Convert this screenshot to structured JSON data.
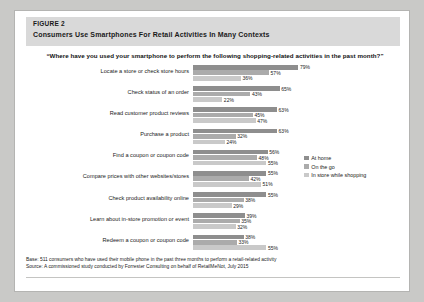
{
  "figure": {
    "number": "FIGURE 2",
    "title": "Consumers Use Smartphones For Retail Activities In Many Contexts",
    "question": "“Where have you used your smartphone to perform the following shopping-related activities in the past month?”"
  },
  "footnotes": {
    "base": "Base: 511 consumers who have used their mobile phone in the past three months to perform a retail-related activity",
    "source": "Source: A commissioned study conducted by Forrester Consulting on behalf of RetailMeNot, July 2015"
  },
  "colors": {
    "series_at_home": "#8e8e8e",
    "series_on_the_go": "#ababab",
    "series_in_store": "#c9c9c9",
    "header_band": "#d9d9d9",
    "page_background": "#c9c9c7",
    "card_background": "#ffffff"
  },
  "chart_data": {
    "type": "bar",
    "orientation": "horizontal",
    "grouped": true,
    "title": "Consumers Use Smartphones For Retail Activities In Many Contexts",
    "subtitle": "“Where have you used your smartphone to perform the following shopping-related activities in the past month?”",
    "xlabel": "",
    "ylabel": "",
    "xlim": [
      0,
      80
    ],
    "grid": false,
    "legend_position": "right",
    "value_suffix": "%",
    "categories": [
      "Locate a store or check store hours",
      "Check status of an order",
      "Read customer product reviews",
      "Purchase a product",
      "Find a coupon or coupon code",
      "Compare prices with other websites/stores",
      "Check product availability online",
      "Learn about in-store promotion or event",
      "Redeem a coupon or coupon code"
    ],
    "series": [
      {
        "name": "At home",
        "color": "#8e8e8e",
        "values": [
          79,
          65,
          63,
          63,
          56,
          55,
          55,
          39,
          38
        ],
        "labels": [
          "79%",
          "65%",
          "63%",
          "63%",
          "56%",
          "55%",
          "55%",
          "39%",
          "38%"
        ]
      },
      {
        "name": "On the go",
        "color": "#ababab",
        "values": [
          57,
          43,
          45,
          32,
          48,
          42,
          38,
          35,
          33
        ],
        "labels": [
          "57%",
          "43%",
          "45%",
          "32%",
          "48%",
          "42%",
          "38%",
          "35%",
          "33%"
        ]
      },
      {
        "name": "In store while shopping",
        "color": "#c9c9c9",
        "values": [
          36,
          22,
          47,
          24,
          55,
          51,
          29,
          32,
          55
        ],
        "labels": [
          "36%",
          "22%",
          "47%",
          "24%",
          "55%",
          "51%",
          "29%",
          "32%",
          "55%"
        ]
      }
    ]
  }
}
